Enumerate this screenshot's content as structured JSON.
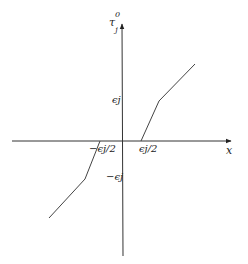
{
  "diagram": {
    "title": "",
    "axes": {
      "x_label": "x",
      "y_label_base": "τ",
      "y_label_sub": "j",
      "y_label_sup": "0"
    },
    "tick_labels": {
      "y_pos": "ϵj",
      "y_neg": "−ϵj",
      "x_pos": "ϵj/2",
      "x_neg": "−ϵj/2"
    },
    "curve": {
      "description": "Piecewise-linear odd function: zero on [−ϵj/2, ϵj/2], steep rise to ϵj, then shallower slope",
      "upper_branch_points": [
        [
          141,
          141
        ],
        [
          159,
          101
        ],
        [
          195,
          64
        ]
      ],
      "lower_branch_points": [
        [
          100,
          141
        ],
        [
          85,
          179
        ],
        [
          49,
          218
        ]
      ]
    },
    "colors": {
      "axis": "#333333",
      "curve": "#444444",
      "text": "#222222"
    }
  }
}
